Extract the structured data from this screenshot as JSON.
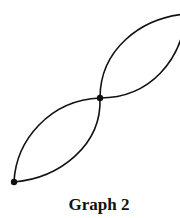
{
  "diagram": {
    "caption": "Graph 2",
    "vertices": [
      {
        "id": "v1",
        "x": 14,
        "y": 182
      },
      {
        "id": "v2",
        "x": 100,
        "y": 98
      },
      {
        "id": "v3",
        "x": 186,
        "y": 14,
        "clipped": true
      }
    ],
    "edges": [
      {
        "from": "v1",
        "to": "v2",
        "curve": "upper"
      },
      {
        "from": "v1",
        "to": "v2",
        "curve": "lower"
      },
      {
        "from": "v2",
        "to": "v3",
        "curve": "upper"
      },
      {
        "from": "v2",
        "to": "v3",
        "curve": "lower"
      }
    ],
    "colors": {
      "stroke": "#111111",
      "background": "#ffffff"
    }
  }
}
